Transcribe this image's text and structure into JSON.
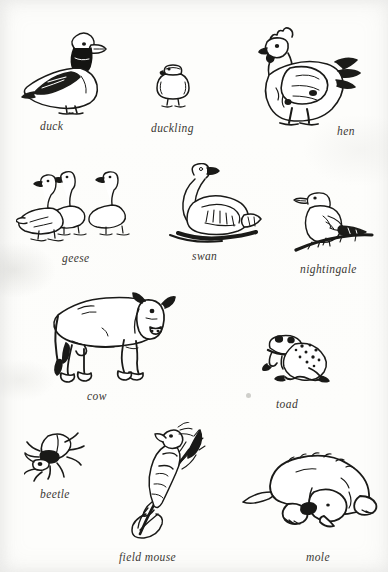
{
  "plate": {
    "kind": "illustrated-animal-plate",
    "background_color": "#fdfdfb",
    "ink_color": "#1a1a18",
    "caption_color": "#3a3733"
  },
  "rows": [
    {
      "row_index": 1,
      "figures": [
        {
          "name": "duck",
          "caption": "duck",
          "caption_x": 40,
          "caption_y": 120
        },
        {
          "name": "duckling",
          "caption": "duckling",
          "caption_x": 151,
          "caption_y": 122
        },
        {
          "name": "hen",
          "caption": "hen",
          "caption_x": 337,
          "caption_y": 125
        }
      ]
    },
    {
      "row_index": 2,
      "figures": [
        {
          "name": "geese",
          "caption": "geese",
          "caption_x": 62,
          "caption_y": 252
        },
        {
          "name": "swan",
          "caption": "swan",
          "caption_x": 192,
          "caption_y": 250
        },
        {
          "name": "nightingale",
          "caption": "nightingale",
          "caption_x": 300,
          "caption_y": 263
        }
      ]
    },
    {
      "row_index": 3,
      "figures": [
        {
          "name": "cow",
          "caption": "cow",
          "caption_x": 87,
          "caption_y": 390
        },
        {
          "name": "toad",
          "caption": "toad",
          "caption_x": 276,
          "caption_y": 398
        }
      ]
    },
    {
      "row_index": 4,
      "figures": [
        {
          "name": "beetle",
          "caption": "beetle",
          "caption_x": 40,
          "caption_y": 488
        },
        {
          "name": "field mouse",
          "caption": "field mouse",
          "caption_x": 119,
          "caption_y": 551
        },
        {
          "name": "mole",
          "caption": "mole",
          "caption_x": 306,
          "caption_y": 551
        }
      ]
    }
  ],
  "captions": {
    "duck": "duck",
    "duckling": "duckling",
    "hen": "hen",
    "geese": "geese",
    "swan": "swan",
    "nightingale": "nightingale",
    "cow": "cow",
    "toad": "toad",
    "beetle": "beetle",
    "field_mouse": "field mouse",
    "mole": "mole"
  }
}
